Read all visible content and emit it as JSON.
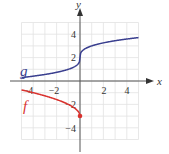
{
  "chart_data": {
    "type": "line",
    "title": "",
    "xlabel": "x",
    "ylabel": "y",
    "xlim": [
      -5,
      5
    ],
    "ylim": [
      -5,
      5
    ],
    "grid": true,
    "x_ticks": [
      "-4",
      "-2",
      "2",
      "4"
    ],
    "y_ticks": [
      "4",
      "2",
      "-2",
      "-4"
    ],
    "series": [
      {
        "name": "g",
        "color": "#3a3f8f",
        "description": "cube-root shaped curve through (0,2)",
        "x": [
          -5,
          -4,
          -3,
          -2,
          -1,
          0,
          1,
          2,
          3,
          4,
          5
        ],
        "values": [
          0.29,
          0.41,
          0.56,
          0.74,
          1.0,
          2.0,
          3.0,
          3.26,
          3.44,
          3.59,
          3.71
        ]
      },
      {
        "name": "f",
        "color": "#d9322e",
        "description": "square-root shaped curve ending at (0,-3) with closed dot",
        "x": [
          -5,
          -4,
          -3,
          -2,
          -1,
          0
        ],
        "values": [
          -0.76,
          -1.0,
          -1.27,
          -1.59,
          -2.0,
          -3.0
        ],
        "endpoint": {
          "x": 0,
          "y": -3,
          "marker": "filled-dot"
        }
      }
    ]
  },
  "labels": {
    "x_axis": "x",
    "y_axis": "y",
    "g": "g",
    "f": "f"
  },
  "ticks": {
    "xm4": "−4",
    "xm2": "−2",
    "x2": "2",
    "x4": "4",
    "y4": "4",
    "y2": "2",
    "ym2": "−2",
    "ym4": "−4"
  }
}
